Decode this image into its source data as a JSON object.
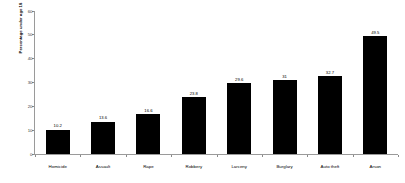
{
  "chart_data": {
    "type": "bar",
    "title": "",
    "subtitle": "",
    "xlabel": "",
    "ylabel": "Percentage under age 18",
    "categories": [
      "Homicide",
      "Assault",
      "Rape",
      "Robbery",
      "Larceny",
      "Burglary",
      "Auto theft",
      "Arson"
    ],
    "values": [
      10.2,
      13.6,
      16.6,
      23.8,
      29.6,
      31,
      32.7,
      49.5
    ],
    "value_labels": [
      "10.2",
      "13.6",
      "16.6",
      "23.8",
      "29.6",
      "31",
      "32.7",
      "49.5"
    ],
    "ylim": [
      0,
      60
    ],
    "ytick_values": [
      0,
      10,
      20,
      30,
      40,
      50,
      60
    ],
    "ytick_labels": [
      "0",
      "10",
      "20",
      "30",
      "40",
      "50",
      "60"
    ],
    "grid": false,
    "legend": false,
    "legend_position": "none",
    "bar_color": "#000000",
    "background_color": "#ffffff",
    "axis_color": "#9a9a9a",
    "label_color": "#000000"
  }
}
